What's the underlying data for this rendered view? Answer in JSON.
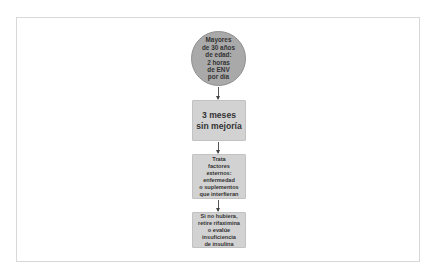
{
  "diagram": {
    "type": "flowchart",
    "direction": "top-to-bottom",
    "nodes": [
      {
        "id": "start",
        "shape": "circle",
        "label": "Mayores\nde 30 años\nde edad:\n2 horas\nde ENV\npor día",
        "fill": "#a9a9a9"
      },
      {
        "id": "step1",
        "shape": "box",
        "label": "3 meses\nsin mejoría",
        "fill": "#d2d2d2"
      },
      {
        "id": "step2",
        "shape": "box",
        "label": "Trata\nfactores\nexternos:\nenfermedad\no suplementos\nque interfieran",
        "fill": "#d2d2d2"
      },
      {
        "id": "step3",
        "shape": "box",
        "label": "Si no hubiera,\nretire rifaximina\no evalúe\ninsuficiencia\nde insulina",
        "fill": "#d2d2d2"
      }
    ],
    "edges": [
      {
        "from": "start",
        "to": "step1"
      },
      {
        "from": "step1",
        "to": "step2"
      },
      {
        "from": "step2",
        "to": "step3"
      }
    ]
  }
}
